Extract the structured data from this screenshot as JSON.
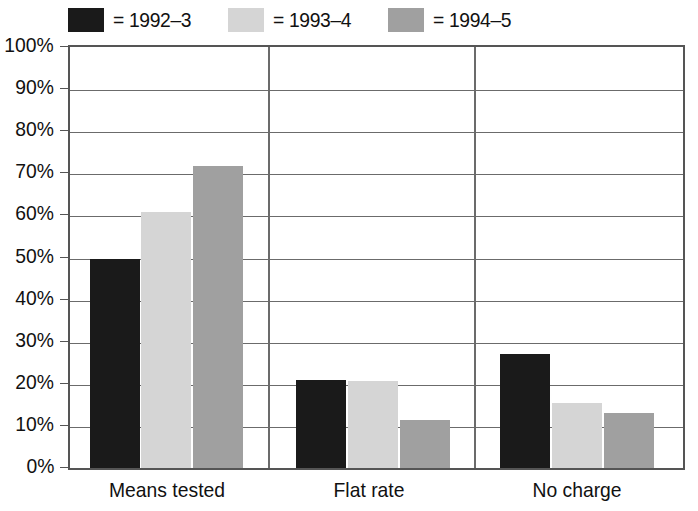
{
  "chart_data": {
    "type": "bar",
    "title": "",
    "xlabel": "",
    "ylabel": "",
    "categories": [
      "Means tested",
      "Flat rate",
      "No charge"
    ],
    "series": [
      {
        "name": "= 1992–3",
        "color": "#1a1a1a",
        "values": [
          49.7,
          20.8,
          27.0
        ]
      },
      {
        "name": "= 1993–4",
        "color": "#d5d5d5",
        "values": [
          60.8,
          20.7,
          15.5
        ]
      },
      {
        "name": "= 1994–5",
        "color": "#a0a0a0",
        "values": [
          11.4,
          11.4,
          13.0
        ]
      }
    ],
    "series_values_corrected": {
      "1992-3": [
        49.7,
        20.8,
        27.0
      ],
      "1993-4": [
        60.8,
        20.7,
        15.5
      ],
      "1994-5": [
        71.7,
        11.4,
        13.0
      ]
    },
    "ylim": [
      0,
      100
    ],
    "ytick_values": [
      0,
      10,
      20,
      30,
      40,
      50,
      60,
      70,
      80,
      90,
      100
    ],
    "ytick_labels": [
      "0%",
      "10%",
      "20%",
      "30%",
      "40%",
      "50%",
      "60%",
      "70%",
      "80%",
      "90%",
      "100%"
    ],
    "grid": true,
    "grid_axis": "y",
    "legend_position": "top",
    "group_separators": true
  },
  "legend": {
    "items": [
      {
        "label": "= 1992–3",
        "color": "#1a1a1a"
      },
      {
        "label": "= 1993–4",
        "color": "#d5d5d5"
      },
      {
        "label": "= 1994–5",
        "color": "#a0a0a0"
      }
    ]
  },
  "axis": {
    "y_labels": [
      "100%",
      "90%",
      "80%",
      "70%",
      "60%",
      "50%",
      "40%",
      "30%",
      "20%",
      "10%",
      "0%"
    ],
    "x_labels": [
      "Means tested",
      "Flat rate",
      "No charge"
    ]
  },
  "colors": {
    "frame": "#555555",
    "grid": "#6b6b6b",
    "series_1": "#1a1a1a",
    "series_2": "#d5d5d5",
    "series_3": "#a0a0a0",
    "background": "#ffffff"
  }
}
